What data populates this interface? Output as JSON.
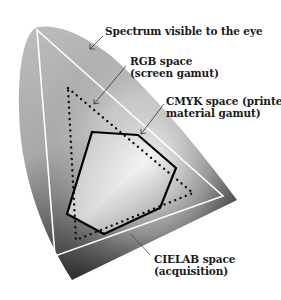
{
  "diagram": {
    "labels": {
      "spectrum": "Spectrum visible to the eye",
      "rgb_line1": "RGB space",
      "rgb_line2": "(screen gamut)",
      "cmyk_line1": "CMYK space (printed",
      "cmyk_line2": "material gamut)",
      "cielab_line1": "CIELAB space",
      "cielab_line2": "(acquisition)"
    },
    "regions": [
      {
        "name": "Spectrum visible to the eye",
        "style": "gradient-filled horseshoe"
      },
      {
        "name": "CIELAB space",
        "style": "white solid triangle"
      },
      {
        "name": "RGB space",
        "style": "black dotted triangle"
      },
      {
        "name": "CMYK space",
        "style": "black solid hexagon"
      }
    ],
    "colors": {
      "background": "#ffffff",
      "spectrum_light": "#bdbdbd",
      "spectrum_dark": "#1e1e1e",
      "cielab_stroke": "#ffffff",
      "rgb_stroke": "#111111",
      "cmyk_stroke": "#000000",
      "text": "#1a1a1a"
    }
  }
}
